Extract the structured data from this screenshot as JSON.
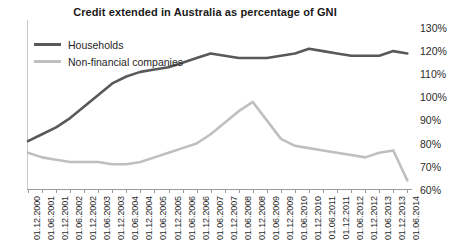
{
  "chart_data": {
    "type": "line",
    "title": "Credit extended in Australia as percentage of GNI",
    "xlabel": "",
    "ylabel": "",
    "ylim": [
      60,
      130
    ],
    "ytick_step": 10,
    "ytick_labels": [
      "130%",
      "120%",
      "110%",
      "100%",
      "90%",
      "80%",
      "70%",
      "60%"
    ],
    "ytick_values": [
      130,
      120,
      110,
      100,
      90,
      80,
      70,
      60
    ],
    "grid": false,
    "legend_position": "top-left",
    "categories": [
      "01.12.2000",
      "01.06.2001",
      "01.12.2001",
      "01.06.2002",
      "01.12.2002",
      "01.06.2003",
      "01.12.2003",
      "01.06.2004",
      "01.12.2004",
      "01.06.2005",
      "01.12.2005",
      "01.06.2006",
      "01.12.2006",
      "01.06.2007",
      "01.12.2007",
      "01.06.2008",
      "01.12.2008",
      "01.06.2009",
      "01.12.2009",
      "01.06.2010",
      "01.12.2010",
      "01.06.2011",
      "01.12.2011",
      "01.06.2012",
      "01.12.2012",
      "01.06.2013",
      "01.12.2013",
      "01.06.2014"
    ],
    "series": [
      {
        "name": "Households",
        "color": "#595959",
        "values": [
          81,
          84,
          87,
          91,
          96,
          101,
          106,
          109,
          111,
          112,
          113,
          115,
          117,
          119,
          118,
          117,
          117,
          117,
          118,
          119,
          121,
          120,
          119,
          118,
          118,
          118,
          120,
          119
        ]
      },
      {
        "name": "Non-financial companies",
        "color": "#bfbfbf",
        "values": [
          76,
          74,
          73,
          72,
          72,
          72,
          71,
          71,
          72,
          74,
          76,
          78,
          80,
          84,
          89,
          94,
          98,
          90,
          82,
          79,
          78,
          77,
          76,
          75,
          74,
          76,
          77,
          64
        ]
      }
    ]
  },
  "legend": {
    "items": [
      {
        "label": "Households",
        "color": "#595959"
      },
      {
        "label": "Non-financial companies",
        "color": "#bfbfbf"
      }
    ]
  }
}
